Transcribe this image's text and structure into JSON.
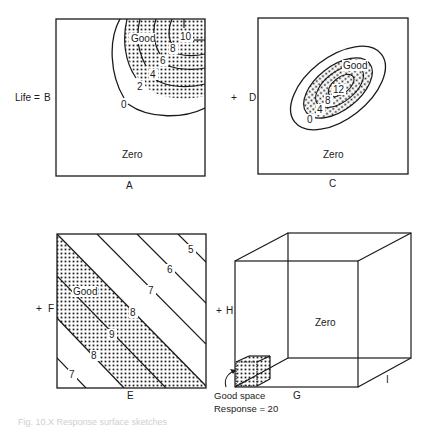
{
  "figure": {
    "caption": "Fig. 10.X  Response surface sketches"
  },
  "panels": [
    {
      "id": "AB",
      "x_axis": "A",
      "y_axis": "B",
      "left_prefix": "Life =",
      "region_label": "Zero",
      "good_label": "Good",
      "contours": [
        "0",
        "2",
        "4",
        "6",
        "8",
        "10"
      ]
    },
    {
      "id": "CD",
      "x_axis": "C",
      "y_axis": "D",
      "left_prefix": "+",
      "region_label": "Zero",
      "good_label": "Good",
      "contours": [
        "0",
        "4",
        "8",
        "12"
      ]
    },
    {
      "id": "EF",
      "x_axis": "E",
      "y_axis": "F",
      "left_prefix": "+",
      "good_label": "Good",
      "contours": [
        "5",
        "6",
        "7",
        "8",
        "9",
        "8",
        "7"
      ]
    },
    {
      "id": "GHI",
      "x_axis": "G",
      "y_axis": "H",
      "z_axis": "I",
      "left_prefix": "+",
      "region_label": "Zero",
      "good_label": "Good space",
      "response_label": "Response = 20"
    }
  ],
  "colors": {
    "ink": "#1a1a1a",
    "dot": "#222222",
    "paper": "#ffffff"
  }
}
